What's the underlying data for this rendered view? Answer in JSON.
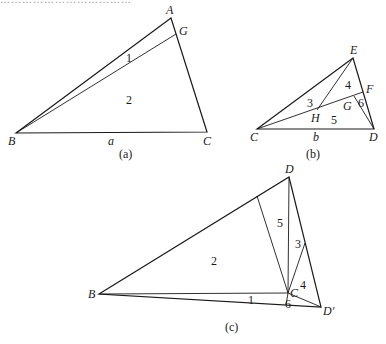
{
  "figures": [
    {
      "id": "a",
      "caption": "(a)",
      "vertices": {
        "A": {
          "label": "A",
          "x": 171,
          "y": 18
        },
        "G": {
          "label": "G",
          "x": 176,
          "y": 34
        },
        "B": {
          "label": "B",
          "x": 16,
          "y": 133
        },
        "C": {
          "label": "C",
          "x": 207,
          "y": 132
        }
      },
      "side_label": "a",
      "regions": [
        {
          "label": "1",
          "x": 128,
          "y": 60
        },
        {
          "label": "2",
          "x": 128,
          "y": 102
        }
      ]
    },
    {
      "id": "b",
      "caption": "(b)",
      "vertices": {
        "C": {
          "label": "C",
          "x": 257,
          "y": 129
        },
        "D": {
          "label": "D",
          "x": 374,
          "y": 129
        },
        "E": {
          "label": "E",
          "x": 353,
          "y": 58
        },
        "F": {
          "label": "F",
          "x": 363,
          "y": 92
        },
        "G": {
          "label": "G",
          "x": 354,
          "y": 96
        },
        "H": {
          "label": "H",
          "x": 317,
          "y": 110
        }
      },
      "side_label": "b",
      "regions": [
        {
          "label": "3",
          "x": 309,
          "y": 106
        },
        {
          "label": "4",
          "x": 347,
          "y": 88
        },
        {
          "label": "5",
          "x": 333,
          "y": 122
        },
        {
          "label": "6",
          "x": 360,
          "y": 108
        }
      ]
    },
    {
      "id": "c",
      "caption": "(c)",
      "vertices": {
        "D": {
          "label": "D",
          "x": 289,
          "y": 177
        },
        "B": {
          "label": "B",
          "x": 99,
          "y": 294
        },
        "C": {
          "label": "C",
          "x": 288,
          "y": 293
        },
        "D_prime": {
          "label": "D′",
          "x": 321,
          "y": 307
        },
        "P": {
          "label": "",
          "x": 257,
          "y": 196
        },
        "Q": {
          "label": "",
          "x": 305,
          "y": 243
        }
      },
      "regions": [
        {
          "label": "2",
          "x": 214,
          "y": 264
        },
        {
          "label": "5",
          "x": 280,
          "y": 226
        },
        {
          "label": "3",
          "x": 298,
          "y": 247
        },
        {
          "label": "4",
          "x": 303,
          "y": 288
        },
        {
          "label": "1",
          "x": 251,
          "y": 303
        },
        {
          "label": "6",
          "x": 288,
          "y": 306
        }
      ]
    }
  ],
  "header_cutoff_text": "………………………………"
}
